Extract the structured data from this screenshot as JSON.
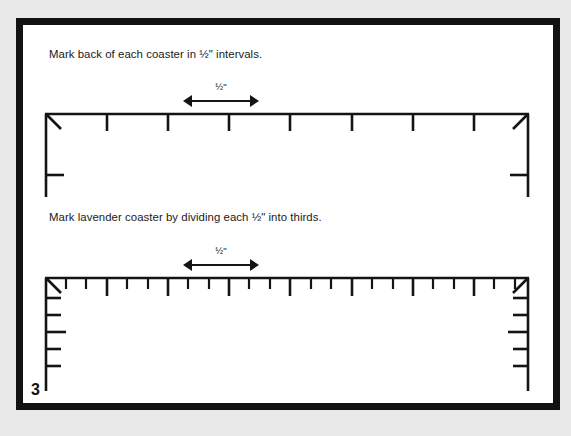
{
  "page": {
    "number": "3",
    "background_color": "#e9e9e9",
    "paper_color": "#ffffff",
    "frame_color": "#121212",
    "ink_color": "#141414"
  },
  "instructions": [
    {
      "id": "instruction-1",
      "text": "Mark back of each coaster in ½\" intervals."
    },
    {
      "id": "instruction-2",
      "text": "Mark lavender coaster by dividing each ½\" into thirds."
    }
  ],
  "dimension_callouts": [
    {
      "id": "dim-1",
      "label": "½\"",
      "style": "double-headed-arrow"
    },
    {
      "id": "dim-2",
      "label": "½\"",
      "style": "double-headed-arrow"
    }
  ],
  "diagrams": [
    {
      "id": "coaster-top",
      "name": "back-of-coaster-half-inch",
      "description": "Coaster back outline with top edge marked in ½\" intervals",
      "top_edge_major_ticks": 8,
      "top_edge_minor_ticks_between": 0,
      "major_tick_spacing_px": 61,
      "left_edge_ticks": 1,
      "right_edge_ticks": 1,
      "corner_miters": 2
    },
    {
      "id": "coaster-bottom",
      "name": "lavender-coaster-thirds",
      "description": "Lavender coaster outline with each ½\" divided into thirds",
      "top_edge_major_ticks": 8,
      "top_edge_minor_ticks_between": 2,
      "major_tick_spacing_px": 61,
      "left_edge_ticks": 6,
      "right_edge_ticks": 6,
      "corner_miters": 2
    }
  ]
}
